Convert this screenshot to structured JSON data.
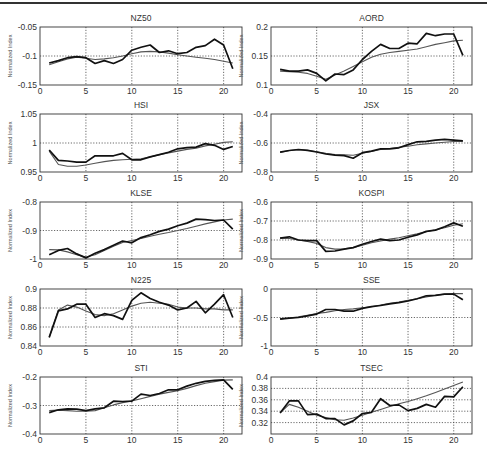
{
  "figure": {
    "ylabel_common": "Normalized Index",
    "xlim": [
      0,
      22
    ],
    "xticks": [
      0,
      5,
      10,
      15,
      20
    ]
  },
  "chart_data": [
    {
      "type": "line",
      "title": "NZ50",
      "xlabel": "",
      "ylabel": "Normalized Index",
      "ylim": [
        -0.15,
        -0.05
      ],
      "yticks": [
        -0.15,
        -0.1,
        -0.05
      ],
      "ytick_labels": [
        "-0.15",
        "-0.1",
        "-0.05"
      ],
      "grid": true,
      "x": [
        1,
        2,
        3,
        4,
        5,
        6,
        7,
        8,
        9,
        10,
        11,
        12,
        13,
        14,
        15,
        16,
        17,
        18,
        19,
        20,
        21
      ],
      "series": [
        {
          "name": "actual",
          "values": [
            -0.112,
            -0.108,
            -0.103,
            -0.101,
            -0.103,
            -0.113,
            -0.108,
            -0.113,
            -0.106,
            -0.09,
            -0.085,
            -0.081,
            -0.094,
            -0.091,
            -0.096,
            -0.094,
            -0.085,
            -0.082,
            -0.071,
            -0.081,
            -0.122
          ]
        },
        {
          "name": "predicted",
          "values": [
            -0.115,
            -0.11,
            -0.105,
            -0.102,
            -0.104,
            -0.106,
            -0.105,
            -0.103,
            -0.1,
            -0.096,
            -0.093,
            -0.092,
            -0.093,
            -0.095,
            -0.098,
            -0.1,
            -0.102,
            -0.104,
            -0.106,
            -0.109,
            -0.112
          ]
        }
      ]
    },
    {
      "type": "line",
      "title": "AORD",
      "xlabel": "",
      "ylabel": "Normalized Index",
      "ylim": [
        0.1,
        0.2
      ],
      "yticks": [
        0.1,
        0.15,
        0.2
      ],
      "ytick_labels": [
        "0.1",
        "0.15",
        "0.2"
      ],
      "grid": true,
      "x": [
        1,
        2,
        3,
        4,
        5,
        6,
        7,
        8,
        9,
        10,
        11,
        12,
        13,
        14,
        15,
        16,
        17,
        18,
        19,
        20,
        21
      ],
      "series": [
        {
          "name": "actual",
          "values": [
            0.127,
            0.124,
            0.124,
            0.126,
            0.12,
            0.107,
            0.119,
            0.118,
            0.126,
            0.144,
            0.158,
            0.17,
            0.163,
            0.163,
            0.172,
            0.171,
            0.189,
            0.185,
            0.188,
            0.188,
            0.151
          ]
        },
        {
          "name": "predicted",
          "values": [
            0.124,
            0.123,
            0.122,
            0.12,
            0.115,
            0.11,
            0.117,
            0.124,
            0.132,
            0.14,
            0.148,
            0.153,
            0.156,
            0.158,
            0.16,
            0.162,
            0.166,
            0.17,
            0.173,
            0.176,
            0.177
          ]
        }
      ]
    },
    {
      "type": "line",
      "title": "HSI",
      "xlabel": "",
      "ylabel": "Normalized Index",
      "ylim": [
        0.95,
        1.05
      ],
      "yticks": [
        0.95,
        1.0,
        1.05
      ],
      "ytick_labels": [
        "0.95",
        "1",
        "1.05"
      ],
      "grid": true,
      "x": [
        1,
        2,
        3,
        4,
        5,
        6,
        7,
        8,
        9,
        10,
        11,
        12,
        13,
        14,
        15,
        16,
        17,
        18,
        19,
        20,
        21
      ],
      "series": [
        {
          "name": "actual",
          "values": [
            0.988,
            0.97,
            0.969,
            0.967,
            0.967,
            0.978,
            0.978,
            0.978,
            0.982,
            0.971,
            0.971,
            0.976,
            0.98,
            0.984,
            0.99,
            0.992,
            0.993,
            0.999,
            0.996,
            0.989,
            0.994
          ]
        },
        {
          "name": "predicted",
          "values": [
            0.986,
            0.963,
            0.96,
            0.96,
            0.962,
            0.965,
            0.968,
            0.97,
            0.971,
            0.972,
            0.973,
            0.976,
            0.98,
            0.983,
            0.986,
            0.989,
            0.991,
            0.995,
            0.998,
            1.001,
            1.002
          ]
        }
      ]
    },
    {
      "type": "line",
      "title": "JSX",
      "xlabel": "",
      "ylabel": "Normalized Index",
      "ylim": [
        -0.8,
        -0.4
      ],
      "yticks": [
        -0.8,
        -0.6,
        -0.4
      ],
      "ytick_labels": [
        "-0.8",
        "-0.6",
        "-0.4"
      ],
      "grid": true,
      "x": [
        1,
        2,
        3,
        4,
        5,
        6,
        7,
        8,
        9,
        10,
        11,
        12,
        13,
        14,
        15,
        16,
        17,
        18,
        19,
        20,
        21
      ],
      "series": [
        {
          "name": "actual",
          "values": [
            -0.663,
            -0.652,
            -0.645,
            -0.651,
            -0.662,
            -0.676,
            -0.684,
            -0.687,
            -0.705,
            -0.667,
            -0.656,
            -0.64,
            -0.64,
            -0.633,
            -0.611,
            -0.592,
            -0.588,
            -0.58,
            -0.575,
            -0.58,
            -0.585
          ]
        },
        {
          "name": "predicted",
          "values": [
            -0.665,
            -0.652,
            -0.646,
            -0.65,
            -0.66,
            -0.672,
            -0.68,
            -0.682,
            -0.684,
            -0.67,
            -0.658,
            -0.645,
            -0.638,
            -0.63,
            -0.622,
            -0.612,
            -0.606,
            -0.6,
            -0.595,
            -0.59,
            -0.588
          ]
        }
      ]
    },
    {
      "type": "line",
      "title": "KLSE",
      "xlabel": "",
      "ylabel": "Normalized Index",
      "ylim": [
        -1.0,
        -0.8
      ],
      "yticks": [
        -1.0,
        -0.9,
        -0.8
      ],
      "ytick_labels": [
        "-1",
        "-0.9",
        "-0.8"
      ],
      "grid": true,
      "x": [
        1,
        2,
        3,
        4,
        5,
        6,
        7,
        8,
        9,
        10,
        11,
        12,
        13,
        14,
        15,
        16,
        17,
        18,
        19,
        20,
        21
      ],
      "series": [
        {
          "name": "actual",
          "values": [
            -0.985,
            -0.97,
            -0.963,
            -0.982,
            -0.996,
            -0.98,
            -0.967,
            -0.952,
            -0.937,
            -0.943,
            -0.925,
            -0.915,
            -0.903,
            -0.895,
            -0.883,
            -0.874,
            -0.86,
            -0.862,
            -0.865,
            -0.863,
            -0.895
          ]
        },
        {
          "name": "predicted",
          "values": [
            -0.967,
            -0.968,
            -0.975,
            -0.985,
            -0.993,
            -0.985,
            -0.97,
            -0.955,
            -0.942,
            -0.935,
            -0.928,
            -0.92,
            -0.913,
            -0.907,
            -0.9,
            -0.893,
            -0.885,
            -0.877,
            -0.87,
            -0.863,
            -0.86
          ]
        }
      ]
    },
    {
      "type": "line",
      "title": "KOSPI",
      "xlabel": "",
      "ylabel": "Normalized Index",
      "ylim": [
        -0.9,
        -0.6
      ],
      "yticks": [
        -0.9,
        -0.8,
        -0.7,
        -0.6
      ],
      "ytick_labels": [
        "-0.9",
        "-0.8",
        "-0.7",
        "-0.6"
      ],
      "grid": true,
      "x": [
        1,
        2,
        3,
        4,
        5,
        6,
        7,
        8,
        9,
        10,
        11,
        12,
        13,
        14,
        15,
        16,
        17,
        18,
        19,
        20,
        21
      ],
      "series": [
        {
          "name": "actual",
          "values": [
            -0.79,
            -0.783,
            -0.8,
            -0.803,
            -0.803,
            -0.86,
            -0.858,
            -0.848,
            -0.84,
            -0.822,
            -0.808,
            -0.795,
            -0.803,
            -0.8,
            -0.785,
            -0.773,
            -0.755,
            -0.748,
            -0.73,
            -0.71,
            -0.728
          ]
        },
        {
          "name": "predicted",
          "values": [
            -0.79,
            -0.792,
            -0.8,
            -0.808,
            -0.818,
            -0.84,
            -0.848,
            -0.847,
            -0.84,
            -0.828,
            -0.815,
            -0.805,
            -0.795,
            -0.788,
            -0.778,
            -0.768,
            -0.757,
            -0.746,
            -0.735,
            -0.722,
            -0.715
          ]
        }
      ]
    },
    {
      "type": "line",
      "title": "N225",
      "xlabel": "",
      "ylabel": "Normalized Index",
      "ylim": [
        0.84,
        0.9
      ],
      "yticks": [
        0.84,
        0.86,
        0.88,
        0.9
      ],
      "ytick_labels": [
        "0.84",
        "0.86",
        "0.88",
        "0.9"
      ],
      "grid": true,
      "x": [
        1,
        2,
        3,
        4,
        5,
        6,
        7,
        8,
        9,
        10,
        11,
        12,
        13,
        14,
        15,
        16,
        17,
        18,
        19,
        20,
        21
      ],
      "series": [
        {
          "name": "actual",
          "values": [
            0.849,
            0.877,
            0.879,
            0.884,
            0.884,
            0.87,
            0.874,
            0.872,
            0.868,
            0.888,
            0.896,
            0.89,
            0.886,
            0.883,
            0.878,
            0.88,
            0.887,
            0.875,
            0.884,
            0.894,
            0.87
          ]
        },
        {
          "name": "predicted",
          "values": [
            0.849,
            0.878,
            0.883,
            0.881,
            0.877,
            0.873,
            0.872,
            0.874,
            0.878,
            0.882,
            0.885,
            0.886,
            0.885,
            0.884,
            0.881,
            0.88,
            0.88,
            0.879,
            0.879,
            0.878,
            0.878
          ]
        }
      ]
    },
    {
      "type": "line",
      "title": "SSE",
      "xlabel": "",
      "ylabel": "Normalized Index",
      "ylim": [
        -1.0,
        0.0
      ],
      "yticks": [
        -1.0,
        -0.5,
        0.0
      ],
      "ytick_labels": [
        "-1",
        "-0.5",
        "0"
      ],
      "grid": true,
      "x": [
        1,
        2,
        3,
        4,
        5,
        6,
        7,
        8,
        9,
        10,
        11,
        12,
        13,
        14,
        15,
        16,
        17,
        18,
        19,
        20,
        21
      ],
      "series": [
        {
          "name": "actual",
          "values": [
            -0.53,
            -0.51,
            -0.5,
            -0.47,
            -0.44,
            -0.36,
            -0.36,
            -0.39,
            -0.39,
            -0.34,
            -0.31,
            -0.29,
            -0.26,
            -0.24,
            -0.21,
            -0.17,
            -0.12,
            -0.11,
            -0.09,
            -0.09,
            -0.19
          ]
        },
        {
          "name": "predicted",
          "values": [
            -0.52,
            -0.51,
            -0.49,
            -0.46,
            -0.43,
            -0.41,
            -0.38,
            -0.36,
            -0.35,
            -0.33,
            -0.31,
            -0.28,
            -0.25,
            -0.23,
            -0.2,
            -0.17,
            -0.14,
            -0.11,
            -0.09,
            -0.08,
            -0.08
          ]
        }
      ]
    },
    {
      "type": "line",
      "title": "STI",
      "xlabel": "",
      "ylabel": "Normalized Index",
      "ylim": [
        -0.4,
        -0.2
      ],
      "yticks": [
        -0.4,
        -0.3,
        -0.2
      ],
      "ytick_labels": [
        "-0.4",
        "-0.3",
        "-0.2"
      ],
      "grid": true,
      "x": [
        1,
        2,
        3,
        4,
        5,
        6,
        7,
        8,
        9,
        10,
        11,
        12,
        13,
        14,
        15,
        16,
        17,
        18,
        19,
        20,
        21
      ],
      "series": [
        {
          "name": "actual",
          "values": [
            -0.325,
            -0.315,
            -0.312,
            -0.313,
            -0.318,
            -0.312,
            -0.308,
            -0.285,
            -0.286,
            -0.285,
            -0.26,
            -0.265,
            -0.258,
            -0.245,
            -0.245,
            -0.232,
            -0.222,
            -0.215,
            -0.212,
            -0.21,
            -0.243
          ]
        },
        {
          "name": "predicted",
          "values": [
            -0.318,
            -0.316,
            -0.318,
            -0.32,
            -0.32,
            -0.318,
            -0.308,
            -0.298,
            -0.29,
            -0.284,
            -0.276,
            -0.268,
            -0.26,
            -0.254,
            -0.248,
            -0.24,
            -0.23,
            -0.222,
            -0.216,
            -0.211,
            -0.21
          ]
        }
      ]
    },
    {
      "type": "line",
      "title": "TSEC",
      "xlabel": "",
      "ylabel": "Normalized Index",
      "ylim": [
        0.3,
        0.4
      ],
      "yticks": [
        0.32,
        0.34,
        0.36,
        0.38,
        0.4
      ],
      "ytick_labels": [
        "0.32",
        "0.34",
        "0.36",
        "0.38",
        "0.4"
      ],
      "grid": true,
      "x": [
        1,
        2,
        3,
        4,
        5,
        6,
        7,
        8,
        9,
        10,
        11,
        12,
        13,
        14,
        15,
        16,
        17,
        18,
        19,
        20,
        21
      ],
      "series": [
        {
          "name": "actual",
          "values": [
            0.337,
            0.358,
            0.358,
            0.334,
            0.335,
            0.327,
            0.327,
            0.316,
            0.323,
            0.336,
            0.338,
            0.362,
            0.35,
            0.351,
            0.341,
            0.345,
            0.352,
            0.347,
            0.366,
            0.365,
            0.383
          ]
        },
        {
          "name": "predicted",
          "values": [
            0.337,
            0.352,
            0.347,
            0.34,
            0.333,
            0.329,
            0.325,
            0.324,
            0.328,
            0.333,
            0.338,
            0.343,
            0.348,
            0.353,
            0.357,
            0.362,
            0.367,
            0.373,
            0.379,
            0.385,
            0.391
          ]
        }
      ]
    }
  ]
}
